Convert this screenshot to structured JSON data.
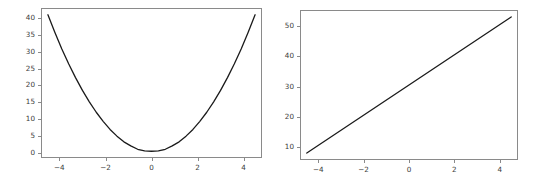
{
  "figure": {
    "background_color": "#ffffff",
    "width": 544,
    "height": 185,
    "line_color": "#1a1a1a",
    "axis_color": "#8a8a8a",
    "tick_label_color": "#3b3b3b"
  },
  "chart_data": [
    {
      "type": "line",
      "name": "left-subplot",
      "title": "",
      "xlabel": "",
      "ylabel": "",
      "xlim": [
        -4.8,
        4.8
      ],
      "ylim": [
        -1.6,
        43.0
      ],
      "xticks": [
        -4,
        -2,
        0,
        2,
        4
      ],
      "xticklabels": [
        "−4",
        "−2",
        "0",
        "2",
        "4"
      ],
      "yticks": [
        0,
        5,
        10,
        15,
        20,
        25,
        30,
        35,
        40
      ],
      "yticklabels": [
        "0",
        "5",
        "10",
        "15",
        "20",
        "25",
        "30",
        "35",
        "40"
      ],
      "grid": false,
      "legend": null,
      "x": [
        -4.5,
        -4.2,
        -3.9,
        -3.6,
        -3.3,
        -3.0,
        -2.7,
        -2.4,
        -2.1,
        -1.8,
        -1.5,
        -1.2,
        -0.9,
        -0.6,
        -0.3,
        0.0,
        0.3,
        0.6,
        0.9,
        1.2,
        1.5,
        1.8,
        2.1,
        2.4,
        2.7,
        3.0,
        3.3,
        3.6,
        3.9,
        4.2,
        4.5
      ],
      "values": [
        41.0,
        35.8,
        30.9,
        26.4,
        22.3,
        18.5,
        15.1,
        12.0,
        9.3,
        6.9,
        4.9,
        3.2,
        2.0,
        1.0,
        0.5,
        0.4,
        0.5,
        1.0,
        2.0,
        3.2,
        4.9,
        6.9,
        9.3,
        12.0,
        15.1,
        18.5,
        22.3,
        26.4,
        30.9,
        35.8,
        41.0
      ]
    },
    {
      "type": "line",
      "name": "right-subplot",
      "title": "",
      "xlabel": "",
      "ylabel": "",
      "xlim": [
        -4.8,
        4.8
      ],
      "ylim": [
        5.7,
        55.3
      ],
      "xticks": [
        -4,
        -2,
        0,
        2,
        4
      ],
      "xticklabels": [
        "−4",
        "−2",
        "0",
        "2",
        "4"
      ],
      "yticks": [
        10,
        20,
        30,
        40,
        50
      ],
      "yticklabels": [
        "10",
        "20",
        "30",
        "40",
        "50"
      ],
      "grid": false,
      "legend": null,
      "x": [
        -4.5,
        4.5
      ],
      "values": [
        8.0,
        53.0
      ]
    }
  ]
}
